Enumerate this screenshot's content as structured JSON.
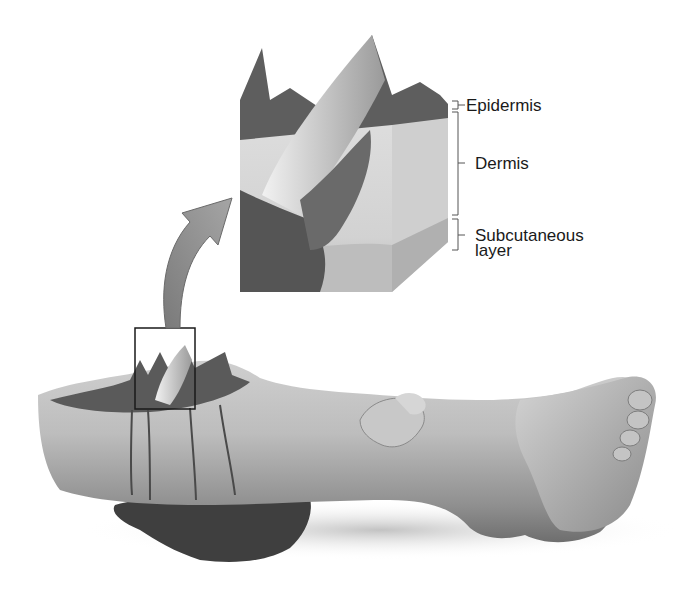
{
  "figure": {
    "colors": {
      "background": "#ffffff",
      "skin_light": "#d9d9d9",
      "skin_mid": "#a9a9a9",
      "skin_dark": "#5a5a5a",
      "blood": "#3c3c3c",
      "arrow": "#8a8a8a",
      "bracket": "#555555",
      "text": "#1a1a1a"
    }
  },
  "labels": {
    "epidermis": "Epidermis",
    "dermis": "Dermis",
    "subcutaneous_line1": "Subcutaneous",
    "subcutaneous_line2": "layer"
  },
  "callouts": {
    "inset": "skin-cross-section-inset",
    "highlight_box": "wound-highlight-box",
    "arrow": "magnify-arrow"
  }
}
